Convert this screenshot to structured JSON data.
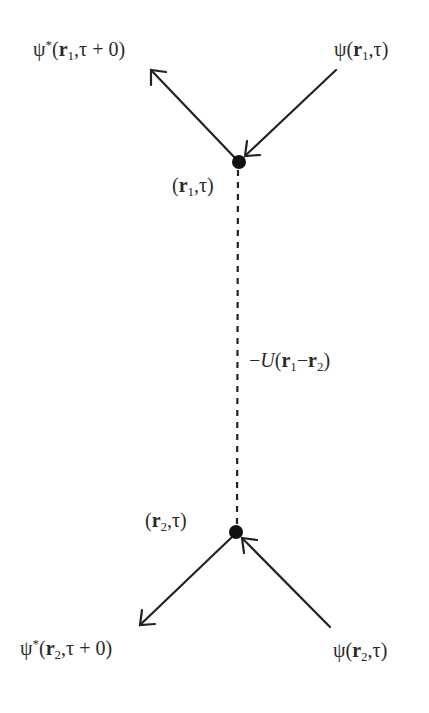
{
  "diagram": {
    "type": "feynman-interaction-vertex",
    "line_color": "#222222",
    "vertex_color": "#111111",
    "vertices": [
      {
        "id": "v1",
        "label": {
          "open": "(",
          "bold": "r",
          "sub": "1",
          "rest": ",τ)"
        }
      },
      {
        "id": "v2",
        "label": {
          "open": "(",
          "bold": "r",
          "sub": "2",
          "rest": ",τ)"
        }
      }
    ],
    "fields": {
      "top_left": {
        "psi": "ψ",
        "star": "*",
        "open": "(",
        "bold": "r",
        "sub": "1",
        "rest": ",τ + 0)",
        "direction": "outgoing"
      },
      "top_right": {
        "psi": "ψ",
        "star": "",
        "open": "(",
        "bold": "r",
        "sub": "1",
        "rest": ",τ)",
        "direction": "incoming"
      },
      "bottom_left": {
        "psi": "ψ",
        "star": "*",
        "open": "(",
        "bold": "r",
        "sub": "2",
        "rest": ",τ + 0)",
        "direction": "outgoing"
      },
      "bottom_right": {
        "psi": "ψ",
        "star": "",
        "open": "(",
        "bold": "r",
        "sub": "2",
        "rest": ",τ)",
        "direction": "incoming"
      }
    },
    "interaction": {
      "style": "dashed",
      "prefix": "−",
      "symbol": "U",
      "open": "(",
      "r1": "r",
      "r1_sub": "1",
      "minus": "−",
      "r2": "r",
      "r2_sub": "2",
      "close": ")"
    }
  }
}
